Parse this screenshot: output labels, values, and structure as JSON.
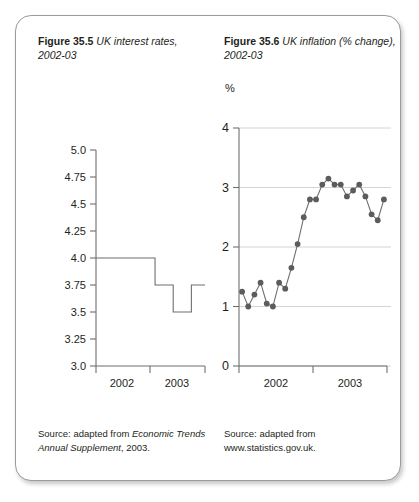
{
  "figures": [
    {
      "id": "fig-35-5",
      "number": "Figure 35.5",
      "title": " UK interest rates, 2002-03",
      "source_prefix": "Source: adapted from ",
      "source_italic": "Economic Trends Annual Supplement",
      "source_suffix": ", 2003."
    },
    {
      "id": "fig-35-6",
      "number": "Figure 35.6",
      "title": " UK inflation (% change), 2002-03",
      "unit_label": "%",
      "source_line1": "Source: adapted from",
      "source_line2": "www.statistics.gov.uk."
    }
  ],
  "colors": {
    "card_border": "#9b9b9b",
    "axis": "#6f6f6f",
    "grid": "#cfcfcf",
    "marker": "#5c5c5c",
    "text": "#231f20",
    "background": "#ffffff"
  },
  "chart_data": [
    {
      "type": "line",
      "title": "UK interest rates, 2002-03",
      "xlabel": "",
      "ylabel": "",
      "grid": false,
      "legend": null,
      "style": "step",
      "ylim": [
        3.0,
        5.0
      ],
      "yticks": [
        "3.0",
        "3.25",
        "3.5",
        "3.75",
        "4.0",
        "4.25",
        "4.5",
        "4.75",
        "5.0"
      ],
      "ytick_values": [
        3.0,
        3.25,
        3.5,
        3.75,
        4.0,
        4.25,
        4.5,
        4.75,
        5.0
      ],
      "xticks": [
        "2002",
        "2003"
      ],
      "xlim": [
        0,
        24
      ],
      "step_segments": [
        {
          "from_month": 0,
          "to_month": 13,
          "value": 4.0
        },
        {
          "from_month": 13,
          "to_month": 17,
          "value": 3.75
        },
        {
          "from_month": 17,
          "to_month": 21,
          "value": 3.5
        },
        {
          "from_month": 21,
          "to_month": 24,
          "value": 3.75
        }
      ]
    },
    {
      "type": "line",
      "title": "UK inflation (% change), 2002-03",
      "xlabel": "",
      "ylabel": "%",
      "grid": true,
      "legend": null,
      "markers": true,
      "ylim": [
        0,
        4
      ],
      "yticks": [
        "0",
        "1",
        "2",
        "3",
        "4"
      ],
      "ytick_values": [
        0,
        1,
        2,
        3,
        4
      ],
      "xticks": [
        "2002",
        "2003"
      ],
      "xlim": [
        0,
        24
      ],
      "x": [
        0,
        1,
        2,
        3,
        4,
        5,
        6,
        7,
        8,
        9,
        10,
        11,
        12,
        13,
        14,
        15,
        16,
        17,
        18,
        19,
        20,
        21,
        22,
        23
      ],
      "values": [
        1.25,
        1.0,
        1.2,
        1.4,
        1.05,
        1.0,
        1.4,
        1.3,
        1.65,
        2.05,
        2.5,
        2.8,
        2.8,
        3.05,
        3.15,
        3.05,
        3.05,
        2.85,
        2.95,
        3.05,
        2.85,
        2.55,
        2.45,
        2.8
      ]
    }
  ]
}
